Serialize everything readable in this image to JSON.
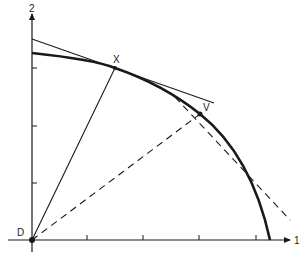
{
  "diagram": {
    "axes": {
      "x_label": "1",
      "y_label": "2",
      "origin_label": "D"
    },
    "points": {
      "x_point_label": "X",
      "v_point_label": "V"
    },
    "colors": {
      "ink": "#1a1a1a",
      "background": "#ffffff"
    },
    "elements": [
      "concave frontier curve",
      "tangent line at X",
      "solid ray from D through X",
      "dashed ray from D through V",
      "dashed tangent at V"
    ]
  }
}
